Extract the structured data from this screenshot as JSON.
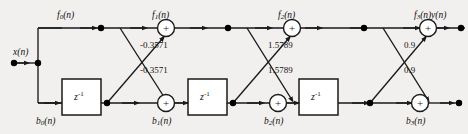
{
  "figure": {
    "type": "signal-flow-graph",
    "name": "lattice-filter-structure",
    "background_color": "#f2f0ee",
    "line_color": "#1a1a1a",
    "node_color": "#000000",
    "box_fill": "#ffffff"
  },
  "signals": {
    "input": "x(n)",
    "output": "y(n)",
    "forward": [
      {
        "id": "f0",
        "base": "f",
        "sub": "0",
        "arg": "(n)",
        "label": "f0(n)"
      },
      {
        "id": "f1",
        "base": "f",
        "sub": "1",
        "arg": "(n)",
        "label": "f1(n)"
      },
      {
        "id": "f2",
        "base": "f",
        "sub": "2",
        "arg": "(n)",
        "label": "f2(n)"
      },
      {
        "id": "f3",
        "base": "f",
        "sub": "3",
        "arg": "(n)",
        "label": "f3(n)"
      }
    ],
    "backward": [
      {
        "id": "b0",
        "base": "b",
        "sub": "0",
        "arg": "(n)",
        "label": "b0(n)"
      },
      {
        "id": "b1",
        "base": "b",
        "sub": "1",
        "arg": "(n)",
        "label": "b1(n)"
      },
      {
        "id": "b2",
        "base": "b",
        "sub": "2",
        "arg": "(n)",
        "label": "b2(n)"
      },
      {
        "id": "b3",
        "base": "b",
        "sub": "3",
        "arg": "(n)",
        "label": "b3(n)"
      }
    ]
  },
  "delays": [
    {
      "id": "z1",
      "label": "z",
      "exponent": "-1"
    },
    {
      "id": "z2",
      "label": "z",
      "exponent": "-1"
    },
    {
      "id": "z3",
      "label": "z",
      "exponent": "-1"
    }
  ],
  "coefficients": [
    {
      "stage": 1,
      "branch": "upper",
      "value": "-0.3571"
    },
    {
      "stage": 1,
      "branch": "lower",
      "value": "-0.3571"
    },
    {
      "stage": 2,
      "branch": "upper",
      "value": "1.5789"
    },
    {
      "stage": 2,
      "branch": "lower",
      "value": "1.5789"
    },
    {
      "stage": 3,
      "branch": "upper",
      "value": "0.9"
    },
    {
      "stage": 3,
      "branch": "lower",
      "value": "0.9"
    }
  ],
  "adders": [
    {
      "id": "f1-adder",
      "symbol": "+",
      "row": "forward"
    },
    {
      "id": "f2-adder",
      "symbol": "+",
      "row": "forward"
    },
    {
      "id": "f3-adder",
      "symbol": "+",
      "row": "forward"
    },
    {
      "id": "b1-adder",
      "symbol": "+",
      "row": "backward"
    },
    {
      "id": "b2-adder",
      "symbol": "+",
      "row": "backward"
    },
    {
      "id": "b3-adder",
      "symbol": "+",
      "row": "backward"
    }
  ]
}
